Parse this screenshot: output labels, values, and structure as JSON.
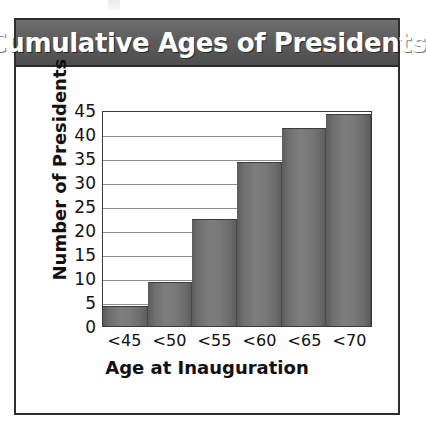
{
  "chart_data": {
    "type": "bar",
    "title": "Cumulative Ages of Presidents",
    "xlabel": "Age at Inauguration",
    "ylabel": "Number of Presidents",
    "categories": [
      "<45",
      "<50",
      "<55",
      "<60",
      "<65",
      "<70"
    ],
    "values": [
      4,
      9,
      22,
      34,
      41,
      44
    ],
    "ylim": [
      0,
      45
    ],
    "ytick_values": [
      0,
      5,
      10,
      15,
      20,
      25,
      30,
      35,
      40,
      45
    ],
    "ytick_labels": [
      "0",
      "5",
      "10",
      "15",
      "20",
      "25",
      "30",
      "35",
      "40",
      "45"
    ],
    "grid": true,
    "legend": false,
    "bar_color": "#767676",
    "title_bar_color": "#5c5c5c",
    "title_text_color": "#ffffff",
    "frame_color": "#2e2e2e",
    "gridline_color": "#8d8d8d"
  }
}
